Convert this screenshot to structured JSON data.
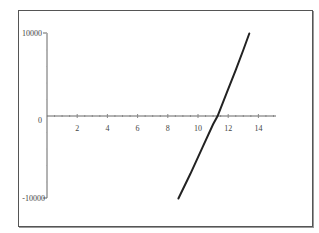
{
  "chart_data": {
    "type": "line",
    "title": "",
    "xlabel": "",
    "ylabel": "",
    "xlim": [
      0,
      15
    ],
    "ylim": [
      -10000,
      10000
    ],
    "x_ticks": [
      "2",
      "4",
      "6",
      "8",
      "10",
      "12",
      "14"
    ],
    "y_ticks": [
      "10000",
      "0",
      "-10000"
    ],
    "grid": false,
    "legend": null,
    "series": [
      {
        "name": "curve",
        "color": "#222222",
        "x": [
          8.7,
          9.5,
          10.3,
          11.0,
          11.3,
          11.9,
          12.5,
          13.0,
          13.4
        ],
        "y": [
          -10000,
          -7000,
          -3800,
          -1000,
          0,
          2800,
          5600,
          8000,
          10000
        ]
      }
    ]
  },
  "axes": {
    "y_top_label": "10000",
    "y_zero_label": "0",
    "y_bottom_label": "-10000",
    "x_labels": [
      "2",
      "4",
      "6",
      "8",
      "10",
      "12",
      "14"
    ]
  }
}
